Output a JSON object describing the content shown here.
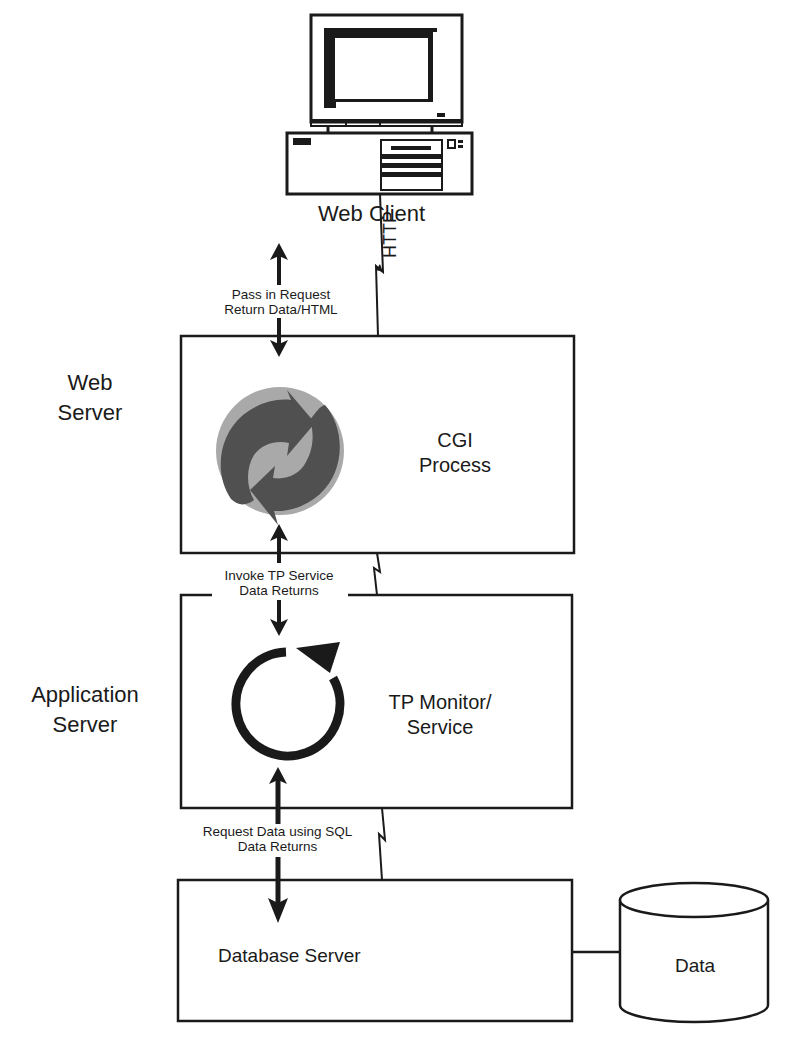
{
  "diagram": {
    "type": "three-tier-architecture",
    "colors": {
      "stroke": "#1a1a1a",
      "background": "#ffffff",
      "recycle_light": "#a9a9a9",
      "recycle_dark": "#505050"
    },
    "client": {
      "icon": "desktop-computer-icon",
      "label": "Web Client",
      "link_label": "HTTP"
    },
    "tiers": [
      {
        "side_label_line1": "Web",
        "side_label_line2": "Server",
        "box_label_line1": "CGI",
        "box_label_line2": "Process",
        "icon": "recycle-arrows-icon"
      },
      {
        "side_label_line1": "Application",
        "side_label_line2": "Server",
        "box_label_line1": "TP Monitor/",
        "box_label_line2": "Service",
        "icon": "circular-loop-arrow-icon"
      },
      {
        "box_label": "Database Server"
      }
    ],
    "connections": [
      {
        "line1": "Pass in Request",
        "line2": "Return Data/HTML"
      },
      {
        "line1": "Invoke TP Service",
        "line2": "Data Returns"
      },
      {
        "line1": "Request Data using SQL",
        "line2": "Data Returns"
      }
    ],
    "datastore": {
      "icon": "database-cylinder-icon",
      "label": "Data"
    }
  }
}
